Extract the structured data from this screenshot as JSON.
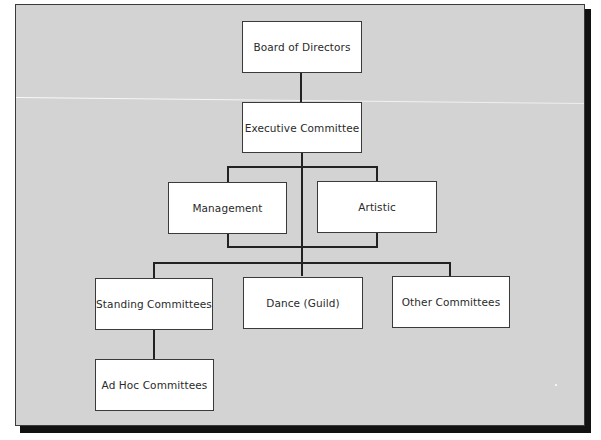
{
  "chart": {
    "type": "organization-chart",
    "nodes": {
      "board": {
        "label": "Board of Directors"
      },
      "executive": {
        "label": "Executive Committee"
      },
      "management": {
        "label": "Management"
      },
      "artistic": {
        "label": "Artistic"
      },
      "standing": {
        "label": "Standing Committees"
      },
      "dance": {
        "label": "Dance (Guild)"
      },
      "other": {
        "label": "Other Committees"
      },
      "adhoc": {
        "label": "Ad Hoc Committees"
      }
    },
    "hierarchy": [
      {
        "parent": "Board of Directors",
        "children": [
          "Executive Committee"
        ]
      },
      {
        "parent": "Executive Committee",
        "children": [
          "Management",
          "Artistic"
        ]
      },
      {
        "parent": "Executive Committee",
        "children": [
          "Standing Committees",
          "Dance (Guild)",
          "Other Committees"
        ]
      },
      {
        "parent": "Standing Committees",
        "children": [
          "Ad Hoc Committees"
        ]
      }
    ],
    "colors": {
      "background": "#d3d3d3",
      "node_fill": "#ffffff",
      "line": "#222222",
      "text": "#2a2a2a"
    }
  }
}
